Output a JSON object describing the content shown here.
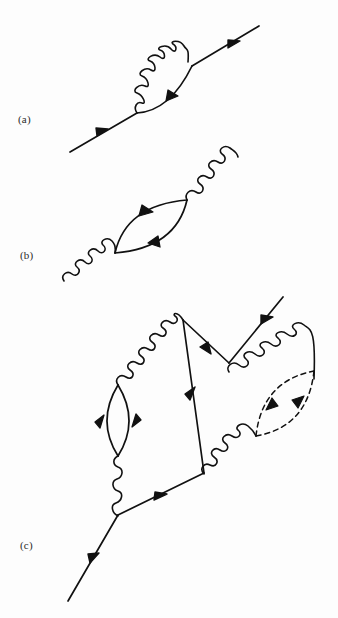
{
  "figure": {
    "kind": "feynman-diagrams",
    "background_color": "#fdfdfd",
    "ink_color": "#111111",
    "width": 338,
    "height": 618,
    "panels": [
      {
        "id": "a",
        "label": "(a)",
        "caption_position": {
          "x": 18,
          "y": 113
        },
        "description": "Fermion self-energy: straight fermion line with a photon (wavy) loop correction",
        "elements": [
          {
            "name": "incoming-fermion-line",
            "type": "fermion-line",
            "from": [
              70,
              152
            ],
            "to": [
              137,
              113
            ],
            "arrow": "mid"
          },
          {
            "name": "outgoing-fermion-line",
            "type": "fermion-line",
            "from": [
              192,
              66
            ],
            "to": [
              258,
              27
            ],
            "arrow": "mid"
          },
          {
            "name": "self-energy-fermion-arc",
            "type": "fermion-arc",
            "from": [
              137,
              113
            ],
            "to": [
              192,
              66
            ],
            "bow": "below-right",
            "arrow": "mid"
          },
          {
            "name": "self-energy-photon-arc",
            "type": "photon-arc",
            "from": [
              137,
              113
            ],
            "to": [
              192,
              66
            ],
            "bow": "above-left",
            "wiggles": 5
          }
        ]
      },
      {
        "id": "b",
        "label": "(b)",
        "caption_position": {
          "x": 20,
          "y": 249
        },
        "description": "Photon self-energy (vacuum polarization): photon line with a fermion bubble loop",
        "elements": [
          {
            "name": "incoming-photon-line",
            "type": "photon-line",
            "from": [
              64,
              279
            ],
            "to": [
              115,
              253
            ],
            "wiggles": 5
          },
          {
            "name": "outgoing-photon-line",
            "type": "photon-line",
            "from": [
              187,
              200
            ],
            "to": [
              238,
              157
            ],
            "wiggles": 5
          },
          {
            "name": "fermion-bubble-upper-arc",
            "type": "fermion-arc",
            "from": [
              115,
              253
            ],
            "to": [
              187,
              200
            ],
            "bow": "above-left",
            "arrow": "mid"
          },
          {
            "name": "fermion-bubble-lower-arc",
            "type": "fermion-arc",
            "from": [
              115,
              253
            ],
            "to": [
              187,
              200
            ],
            "bow": "below-right",
            "arrow": "mid"
          }
        ]
      },
      {
        "id": "c",
        "label": "(c)",
        "caption_position": {
          "x": 20,
          "y": 539
        },
        "description": "Higher order vertex correction with a fermion bubble on the left photon and a dashed loop on the right photon",
        "elements": [
          {
            "name": "incoming-fermion-line-c",
            "type": "fermion-line",
            "from": [
              68,
              600
            ],
            "to": [
              118,
              515
            ],
            "arrow": "mid"
          },
          {
            "name": "lower-fermion-line-c",
            "type": "fermion-line",
            "from": [
              118,
              515
            ],
            "to": [
              203,
              473
            ],
            "arrow": "mid"
          },
          {
            "name": "vertical-fermion-line-c",
            "type": "fermion-line",
            "from": [
              203,
              473
            ],
            "to": [
              183,
              320
            ],
            "arrow": "mid"
          },
          {
            "name": "descending-fermion-line-c",
            "type": "fermion-line",
            "from": [
              183,
              320
            ],
            "to": [
              228,
              363
            ],
            "arrow": "mid"
          },
          {
            "name": "outgoing-fermion-line-c",
            "type": "fermion-line",
            "from": [
              228,
              363
            ],
            "to": [
              282,
              298
            ],
            "arrow": "mid"
          },
          {
            "name": "left-photon-lower-segment",
            "type": "photon-line",
            "from": [
              118,
              515
            ],
            "to": [
              118,
              455
            ],
            "wiggles": 4
          },
          {
            "name": "left-photon-upper-segment",
            "type": "photon-line",
            "from": [
              118,
              385
            ],
            "to": [
              183,
              320
            ],
            "wiggles": 7
          },
          {
            "name": "left-bubble-left-arc",
            "type": "fermion-arc",
            "from": [
              118,
              455
            ],
            "to": [
              118,
              385
            ],
            "bow": "left",
            "arrow": "mid"
          },
          {
            "name": "left-bubble-right-arc",
            "type": "fermion-arc",
            "from": [
              118,
              455
            ],
            "to": [
              118,
              385
            ],
            "bow": "right",
            "arrow": "mid"
          },
          {
            "name": "upper-right-photon-line",
            "type": "photon-line",
            "from": [
              228,
              363
            ],
            "to": [
              314,
              371
            ],
            "wiggles": 8
          },
          {
            "name": "lower-right-photon-line",
            "type": "photon-line",
            "from": [
              203,
              473
            ],
            "to": [
              256,
              436
            ],
            "wiggles": 5
          },
          {
            "name": "dashed-loop-upper-arc",
            "type": "dashed-arc",
            "from": [
              256,
              436
            ],
            "to": [
              314,
              371
            ],
            "bow": "above-left",
            "arrow": "mid"
          },
          {
            "name": "dashed-loop-lower-arc",
            "type": "dashed-arc",
            "from": [
              256,
              436
            ],
            "to": [
              314,
              371
            ],
            "bow": "below-right",
            "arrow": "mid"
          }
        ]
      }
    ]
  }
}
